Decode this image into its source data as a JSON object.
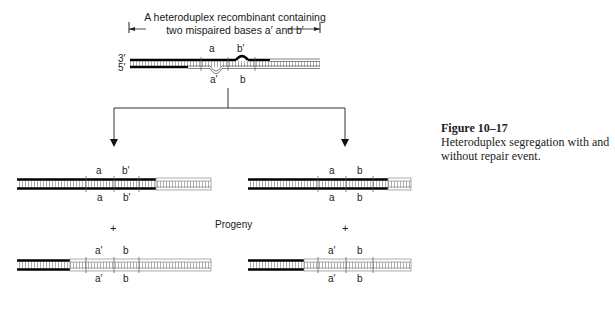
{
  "figure": {
    "number": "Figure 10–17",
    "caption": "Heteroduplex segregation with and without repair event."
  },
  "top_molecule": {
    "header_line1": "A heteroduplex recombinant containing",
    "header_line2": "two mispaired bases a′ and b′",
    "strand_top_label": "3′",
    "strand_bottom_label": "5′",
    "top_marks": [
      "a",
      "b′"
    ],
    "bottom_marks": [
      "a′",
      "b"
    ]
  },
  "left_branch": {
    "upper_molecule": {
      "top_marks": [
        "a",
        "b′"
      ],
      "bottom_marks": [
        "a",
        "b′"
      ]
    },
    "lower_molecule": {
      "top_marks": [
        "a′",
        "b"
      ],
      "bottom_marks": [
        "a′",
        "b"
      ]
    }
  },
  "right_branch": {
    "upper_molecule": {
      "top_marks": [
        "a",
        "b"
      ],
      "bottom_marks": [
        "a",
        "b"
      ]
    },
    "lower_molecule": {
      "top_marks": [
        "a′",
        "b"
      ],
      "bottom_marks": [
        "a′",
        "b"
      ]
    }
  },
  "labels": {
    "plus": "+",
    "progeny": "Progeny"
  }
}
